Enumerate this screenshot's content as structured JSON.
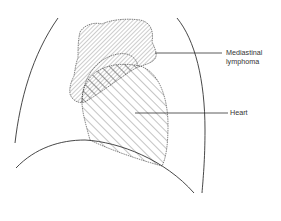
{
  "diagram": {
    "type": "anatomical-line-drawing",
    "labels": {
      "lymphoma_line1": "Mediastinal",
      "lymphoma_line2": "lymphoma",
      "heart": "Heart"
    },
    "colors": {
      "stroke": "#333333",
      "hatch": "#555555",
      "background": "#ffffff"
    },
    "structures": [
      "left-lung-border",
      "right-lung-border",
      "diaphragm",
      "mediastinal-lymphoma",
      "heart"
    ]
  }
}
